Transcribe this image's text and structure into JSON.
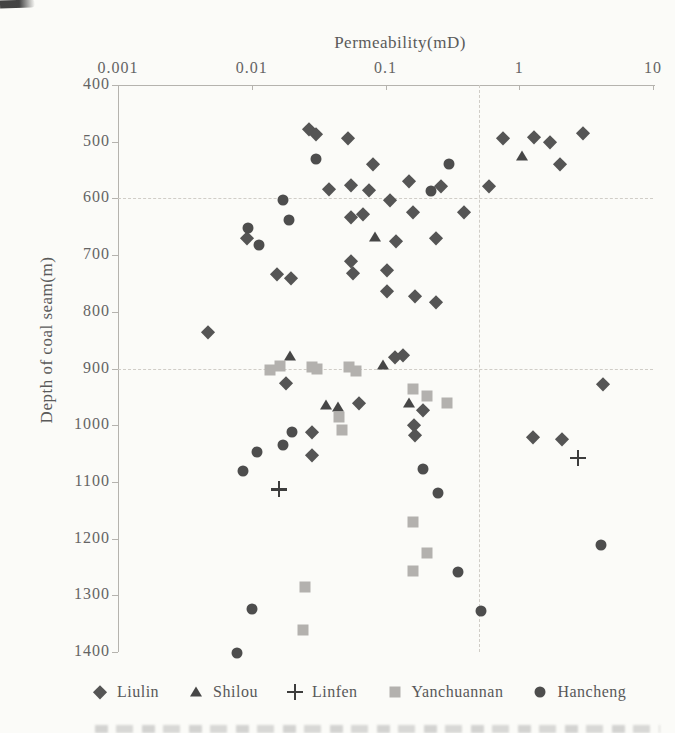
{
  "figure": {
    "background_color": "#fbfbf8",
    "bottom_caption_cutoff": true,
    "scan_mark_top_left": true
  },
  "chart_data": {
    "type": "scatter",
    "x_axis": {
      "label": "Permeability(mD)",
      "scale": "log",
      "position": "top",
      "range": [
        0.001,
        10
      ],
      "ticks": [
        0.001,
        0.01,
        0.1,
        1,
        10
      ],
      "tick_labels": [
        "0.001",
        "0.01",
        "0.1",
        "1",
        "10"
      ]
    },
    "y_axis": {
      "label": "Depth of coal seam(m)",
      "inverted": true,
      "range": [
        400,
        1400
      ],
      "ticks": [
        400,
        500,
        600,
        700,
        800,
        900,
        1000,
        1100,
        1200,
        1300,
        1400
      ]
    },
    "gridlines": {
      "style": "dashed",
      "horizontal_depths": [
        600,
        900
      ],
      "vertical_perms": [
        0.5
      ]
    },
    "legend_position": "bottom",
    "series": [
      {
        "name": "Liulin",
        "marker": "diamond",
        "color": "#555555",
        "points": [
          [
            0.027,
            478
          ],
          [
            0.03,
            487
          ],
          [
            0.052,
            494
          ],
          [
            0.08,
            540
          ],
          [
            0.055,
            577
          ],
          [
            0.038,
            583
          ],
          [
            0.075,
            585
          ],
          [
            0.75,
            494
          ],
          [
            1.3,
            492
          ],
          [
            1.7,
            500
          ],
          [
            3.0,
            485
          ],
          [
            2.0,
            539
          ],
          [
            0.15,
            569
          ],
          [
            0.26,
            578
          ],
          [
            0.59,
            578
          ],
          [
            0.108,
            603
          ],
          [
            0.16,
            624
          ],
          [
            0.385,
            624
          ],
          [
            0.055,
            633
          ],
          [
            0.068,
            628
          ],
          [
            0.0092,
            670
          ],
          [
            0.12,
            676
          ],
          [
            0.24,
            670
          ],
          [
            0.055,
            710
          ],
          [
            0.057,
            732
          ],
          [
            0.102,
            726
          ],
          [
            0.102,
            763
          ],
          [
            0.0155,
            734
          ],
          [
            0.0195,
            740
          ],
          [
            0.165,
            772
          ],
          [
            0.24,
            782
          ],
          [
            0.0047,
            835
          ],
          [
            0.118,
            880
          ],
          [
            0.135,
            877
          ],
          [
            0.018,
            926
          ],
          [
            4.2,
            927
          ],
          [
            0.19,
            974
          ],
          [
            0.063,
            960
          ],
          [
            0.163,
            1000
          ],
          [
            0.166,
            1017
          ],
          [
            0.028,
            1012
          ],
          [
            0.028,
            1053
          ],
          [
            1.27,
            1020
          ],
          [
            2.1,
            1025
          ]
        ]
      },
      {
        "name": "Shilou",
        "marker": "triangle",
        "color": "#464646",
        "points": [
          [
            1.05,
            525
          ],
          [
            0.084,
            668
          ],
          [
            0.0193,
            878
          ],
          [
            0.095,
            894
          ],
          [
            0.036,
            964
          ],
          [
            0.044,
            968
          ],
          [
            0.15,
            960
          ]
        ]
      },
      {
        "name": "Linfen",
        "marker": "plus",
        "color": "#3d3d3d",
        "points": [
          [
            0.016,
            1113
          ],
          [
            2.75,
            1058
          ]
        ]
      },
      {
        "name": "Yanchuannan",
        "marker": "square",
        "color": "#b3b1ae",
        "points": [
          [
            0.0137,
            903
          ],
          [
            0.0163,
            896
          ],
          [
            0.028,
            898
          ],
          [
            0.031,
            900
          ],
          [
            0.0535,
            897
          ],
          [
            0.0605,
            904
          ],
          [
            0.16,
            936
          ],
          [
            0.205,
            949
          ],
          [
            0.29,
            960
          ],
          [
            0.045,
            986
          ],
          [
            0.047,
            1009
          ],
          [
            0.16,
            1170
          ],
          [
            0.205,
            1226
          ],
          [
            0.16,
            1257
          ],
          [
            0.025,
            1286
          ],
          [
            0.024,
            1361
          ]
        ]
      },
      {
        "name": "Hancheng",
        "marker": "circle",
        "color": "#4d4d4d",
        "points": [
          [
            0.03,
            530
          ],
          [
            0.3,
            539
          ],
          [
            0.22,
            587
          ],
          [
            0.017,
            603
          ],
          [
            0.019,
            638
          ],
          [
            0.0094,
            652
          ],
          [
            0.0113,
            682
          ],
          [
            0.02,
            1012
          ],
          [
            0.017,
            1035
          ],
          [
            0.011,
            1047
          ],
          [
            0.0086,
            1080
          ],
          [
            0.19,
            1078
          ],
          [
            0.245,
            1119
          ],
          [
            4.1,
            1212
          ],
          [
            0.35,
            1259
          ],
          [
            0.52,
            1328
          ],
          [
            0.01,
            1325
          ],
          [
            0.0078,
            1402
          ]
        ]
      }
    ]
  }
}
